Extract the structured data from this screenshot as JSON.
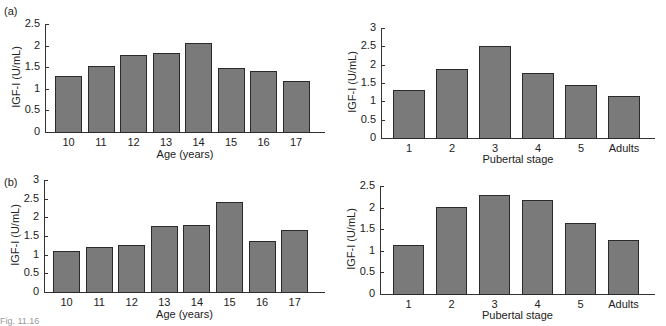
{
  "panels": {
    "a": "(a)",
    "b": "(b)"
  },
  "caption_fragment": "Fig. 11.16",
  "chart_data": [
    {
      "id": "a-age",
      "panel": "(a)",
      "type": "bar",
      "xlabel": "Age (years)",
      "ylabel": "IGF-I (U/mL)",
      "categories": [
        "10",
        "11",
        "12",
        "13",
        "14",
        "15",
        "16",
        "17"
      ],
      "values": [
        1.3,
        1.52,
        1.79,
        1.83,
        2.06,
        1.47,
        1.42,
        1.17
      ],
      "ylim": [
        0,
        2.5
      ],
      "yticks": [
        "0",
        "0.5",
        "1",
        "1.5",
        "2",
        "2.5"
      ],
      "grid": false
    },
    {
      "id": "a-pubertal",
      "panel": "(a)",
      "type": "bar",
      "xlabel": "Pubertal stage",
      "ylabel": "IGF-I (U/mL)",
      "categories": [
        "1",
        "2",
        "3",
        "4",
        "5",
        "Adults"
      ],
      "values": [
        1.31,
        1.88,
        2.51,
        1.76,
        1.44,
        1.15
      ],
      "ylim": [
        0,
        3
      ],
      "yticks": [
        "0",
        "0.5",
        "1",
        "1.5",
        "2",
        "2.5",
        "3"
      ],
      "grid": false
    },
    {
      "id": "b-age",
      "panel": "(b)",
      "type": "bar",
      "xlabel": "Age (years)",
      "ylabel": "IGF-I (U/mL)",
      "categories": [
        "10",
        "11",
        "12",
        "13",
        "14",
        "15",
        "16",
        "17"
      ],
      "values": [
        1.11,
        1.21,
        1.25,
        1.76,
        1.8,
        2.4,
        1.36,
        1.65
      ],
      "ylim": [
        0,
        3
      ],
      "yticks": [
        "0",
        "0.5",
        "1",
        "1.5",
        "2",
        "2.5",
        "3"
      ],
      "grid": false
    },
    {
      "id": "b-pubertal",
      "panel": "(b)",
      "type": "bar",
      "xlabel": "Pubertal stage",
      "ylabel": "IGF-I (U/mL)",
      "categories": [
        "1",
        "2",
        "3",
        "4",
        "5",
        "Adults"
      ],
      "values": [
        1.13,
        2.02,
        2.3,
        2.18,
        1.65,
        1.25
      ],
      "ylim": [
        0,
        2.5
      ],
      "yticks": [
        "0",
        "0.5",
        "1",
        "1.5",
        "2",
        "2.5"
      ],
      "grid": false
    }
  ],
  "layout": [
    {
      "axisX": 45,
      "top": 24,
      "base": 132,
      "right": 325,
      "barStart": 55,
      "barW": 27,
      "barGap": 32.5,
      "xlabelY": 148,
      "ylabelX": 16
    },
    {
      "axisX": 381,
      "top": 28,
      "base": 138,
      "right": 655,
      "barStart": 393,
      "barW": 32,
      "barGap": 43,
      "xlabelY": 153,
      "ylabelX": 352
    },
    {
      "axisX": 44,
      "top": 180,
      "base": 292,
      "right": 325,
      "barStart": 53,
      "barW": 27,
      "barGap": 32.6,
      "xlabelY": 308,
      "ylabelX": 15
    },
    {
      "axisX": 380,
      "top": 186,
      "base": 294,
      "right": 655,
      "barStart": 393,
      "barW": 31,
      "barGap": 43,
      "xlabelY": 309,
      "ylabelX": 351
    }
  ]
}
